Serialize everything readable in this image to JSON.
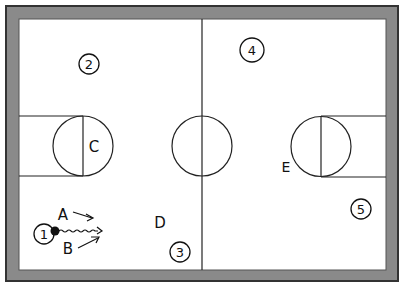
{
  "diagram": {
    "type": "basketball-court-play",
    "colors": {
      "border": "#8a8a8a",
      "border_edge": "#333333",
      "court": "#ffffff",
      "line": "#222222"
    },
    "players": [
      {
        "id": "1",
        "label": "1",
        "x": 44,
        "y": 234
      },
      {
        "id": "2",
        "label": "2",
        "x": 89,
        "y": 64
      },
      {
        "id": "3",
        "label": "3",
        "x": 180,
        "y": 252
      },
      {
        "id": "4",
        "label": "4",
        "x": 252,
        "y": 50
      },
      {
        "id": "5",
        "label": "5",
        "x": 361,
        "y": 209
      }
    ],
    "markers": [
      {
        "id": "A",
        "label": "A",
        "x": 64,
        "y": 220
      },
      {
        "id": "B",
        "label": "B",
        "x": 68,
        "y": 254
      },
      {
        "id": "C",
        "label": "C",
        "x": 93,
        "y": 154
      },
      {
        "id": "D",
        "label": "D",
        "x": 160,
        "y": 230
      },
      {
        "id": "E",
        "label": "E",
        "x": 285,
        "y": 174
      }
    ],
    "ball": {
      "holder": "1",
      "x": 55,
      "y": 231
    }
  }
}
